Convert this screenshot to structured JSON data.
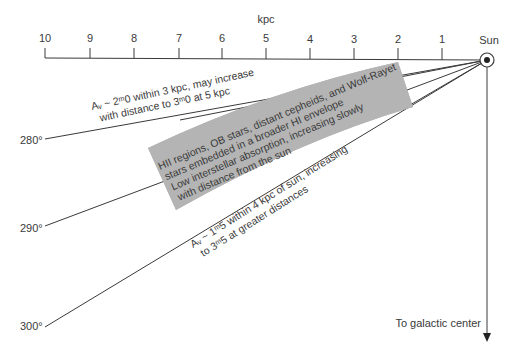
{
  "axis": {
    "unit_label": "kpc",
    "ticks": [
      "10",
      "9",
      "8",
      "7",
      "6",
      "5",
      "4",
      "3",
      "2",
      "1"
    ],
    "origin_label": "Sun"
  },
  "longitude_lines": [
    {
      "label": "280°"
    },
    {
      "label": "290°"
    },
    {
      "label": "300°"
    }
  ],
  "annotations": {
    "upper": {
      "line1": "Aᵥ ~ 2ᵐ.0 within 3 kpc, may increase",
      "line1_text": "Aᵥ ~ 2ᵐ0 within 3 kpc, may increase",
      "line2": "with distance to 3ᵐ0 at 5 kpc"
    },
    "band": {
      "line1": "HII regions, OB stars, distant cepheids, and Wolf-Rayet",
      "line2": "stars embedded in a broader HI envelope",
      "line3": "Low interstellar absorption, increasing slowly",
      "line4": "with distance from the sun"
    },
    "lower": {
      "line1": "Aᵥ ~ 1ᵐ5 within 4 kpc of sun, increasing",
      "line2": "to 3ᵐ5 at greater distances"
    },
    "arrow_label": "To galactic center"
  },
  "colors": {
    "ink": "#3a3a3a",
    "band_fill": "#b4b4b4"
  }
}
